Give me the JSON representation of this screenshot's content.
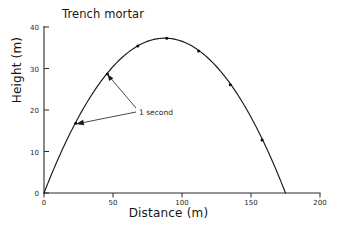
{
  "chart_data": {
    "type": "line",
    "title": "Trench mortar",
    "xlabel": "Distance (m)",
    "ylabel": "Height (m)",
    "xlim": [
      0,
      200
    ],
    "ylim": [
      0,
      40
    ],
    "xticks": [
      0,
      50,
      100,
      150,
      200
    ],
    "yticks": [
      0,
      10,
      20,
      30,
      40
    ],
    "xtick_labels": [
      "0",
      "50",
      "100",
      "150",
      "200"
    ],
    "ytick_labels": [
      "0",
      "10",
      "20",
      "30",
      "40"
    ],
    "grid": false,
    "legend": false,
    "series": [
      {
        "name": "Trajectory",
        "x": [
          0,
          23,
          46,
          68,
          89,
          112,
          135,
          158,
          175
        ],
        "y": [
          0,
          16.8,
          28.7,
          35.4,
          37.3,
          34.2,
          26.1,
          12.8,
          0
        ]
      }
    ],
    "markers": {
      "x": [
        23,
        46,
        68,
        89,
        112,
        135,
        158
      ],
      "y": [
        16.8,
        28.7,
        35.4,
        37.3,
        34.2,
        26.1,
        12.8
      ],
      "note": "data points spaced at 1 second intervals"
    },
    "annotations": [
      {
        "text": "1 second",
        "points_to": [
          [
            46,
            28.7
          ],
          [
            23,
            16.8
          ]
        ],
        "label_x": 90,
        "label_y": 20
      }
    ]
  },
  "figure": {
    "title": "Trench mortar",
    "x_axis_title": "Distance (m)",
    "y_axis_title": "Height (m)",
    "annotation_text": "1 second"
  }
}
